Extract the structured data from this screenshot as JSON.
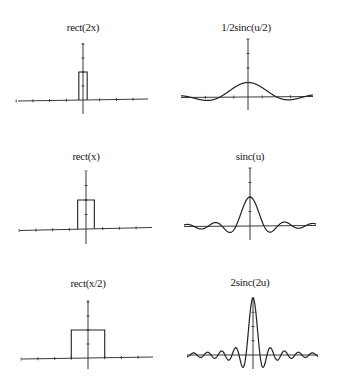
{
  "chart_data": [
    {
      "type": "line",
      "id": "rect-2x",
      "title": "rect(2x)",
      "function": "rect",
      "width": 0.5,
      "amplitude": 1,
      "xlabel": "",
      "ylabel": "",
      "xlim": [
        -4,
        4
      ],
      "x_ticks": [
        -4,
        -3,
        -2,
        -1,
        1,
        2,
        3
      ],
      "y_ticks": [
        0.5,
        1,
        1.5,
        2
      ],
      "grid": false,
      "legend": false
    },
    {
      "type": "line",
      "id": "half-sinc-half-u",
      "title": "1/2sinc(u/2)",
      "function": "sinc",
      "scale": 0.5,
      "amplitude": 0.5,
      "xlabel": "",
      "ylabel": "",
      "xlim": [
        -4.7,
        4.7
      ],
      "x_ticks": [
        -3,
        -1,
        1,
        3
      ],
      "y_ticks": [
        0.5,
        1,
        1.5,
        2
      ],
      "grid": false,
      "legend": false
    },
    {
      "type": "line",
      "id": "rect-x",
      "title": "rect(x)",
      "function": "rect",
      "width": 1,
      "amplitude": 1,
      "xlabel": "",
      "ylabel": "",
      "xlim": [
        -4,
        4
      ],
      "x_ticks": [
        -4,
        -3,
        -2,
        -1,
        1,
        2,
        3
      ],
      "y_ticks": [
        0.5,
        1,
        1.5,
        2
      ],
      "grid": false,
      "legend": false
    },
    {
      "type": "line",
      "id": "sinc-u",
      "title": "sinc(u)",
      "function": "sinc",
      "scale": 1,
      "amplitude": 1,
      "xlabel": "",
      "ylabel": "",
      "xlim": [
        -4.7,
        4.7
      ],
      "x_ticks": [],
      "y_ticks": [
        0.5,
        1,
        1.5,
        2
      ],
      "grid": false,
      "legend": false
    },
    {
      "type": "line",
      "id": "rect-x-half",
      "title": "rect(x/2)",
      "function": "rect",
      "width": 2,
      "amplitude": 1,
      "xlabel": "",
      "ylabel": "",
      "xlim": [
        -4,
        4
      ],
      "x_ticks": [
        -4,
        -3,
        -2,
        -1,
        1,
        2,
        3
      ],
      "y_ticks": [
        0.5,
        1,
        1.5,
        2
      ],
      "grid": false,
      "legend": false
    },
    {
      "type": "line",
      "id": "two-sinc-2u",
      "title": "2sinc(2u)",
      "function": "sinc",
      "scale": 2,
      "amplitude": 2,
      "xlabel": "",
      "ylabel": "",
      "xlim": [
        -4.7,
        4.7
      ],
      "x_ticks": [],
      "y_ticks": [
        0.5,
        1,
        1.5,
        2
      ],
      "grid": false,
      "legend": false
    }
  ],
  "layout": [
    {
      "title_x": 83,
      "title_y": 21,
      "ox": 83,
      "oy": 100,
      "xl": 18,
      "xr": 148,
      "tilt": -2,
      "yt": 43,
      "yb": 114,
      "ux": 16.7,
      "uy": 28
    },
    {
      "title_x": 246,
      "title_y": 21,
      "ox": 248,
      "oy": 97,
      "xl": 181,
      "xr": 313,
      "tilt": -1,
      "yt": 39,
      "yb": 110,
      "ux": 14.2,
      "uy": 29
    },
    {
      "title_x": 86,
      "title_y": 150,
      "ox": 86,
      "oy": 229,
      "xl": 20,
      "xr": 152,
      "tilt": -3,
      "yt": 172,
      "yb": 244,
      "ux": 16.7,
      "uy": 29
    },
    {
      "title_x": 250,
      "title_y": 150,
      "ox": 250,
      "oy": 226,
      "xl": 184,
      "xr": 316,
      "tilt": -1,
      "yt": 168,
      "yb": 240,
      "ux": 14,
      "uy": 29
    },
    {
      "title_x": 88,
      "title_y": 277,
      "ox": 88,
      "oy": 358,
      "xl": 22,
      "xr": 153,
      "tilt": -2,
      "yt": 300,
      "yb": 369,
      "ux": 16.7,
      "uy": 28
    },
    {
      "title_x": 250,
      "title_y": 276,
      "ox": 253,
      "oy": 355,
      "xl": 187,
      "xr": 318,
      "tilt": 0,
      "yt": 298,
      "yb": 369,
      "ux": 14,
      "uy": 28.5
    }
  ],
  "style": {
    "ink": "#222222",
    "background": "#ffffff"
  }
}
